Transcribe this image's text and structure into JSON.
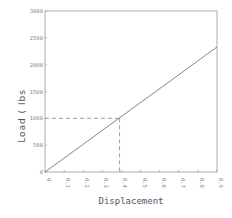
{
  "chart_data": {
    "type": "line",
    "title": "",
    "xlabel": "Displacement",
    "ylabel": "Load ( lbs",
    "xlim": [
      0,
      0.9
    ],
    "ylim": [
      0,
      3000
    ],
    "x_ticks": [
      "0",
      "0.1",
      "0.2",
      "0.3",
      "0.4",
      "0.5",
      "0.6",
      "0.7",
      "0.8",
      "0.9"
    ],
    "y_ticks": [
      "0",
      "500",
      "1000",
      "1500",
      "2000",
      "2500",
      "3000"
    ],
    "grid": false,
    "series": [
      {
        "name": "Load vs Displacement",
        "x": [
          0,
          0.9
        ],
        "y": [
          0,
          2330
        ],
        "color": "#777777"
      }
    ],
    "annotations": [
      {
        "type": "dashed-guide",
        "x": 0.39,
        "y": 1000,
        "label": ""
      }
    ]
  },
  "labels": {
    "xlabel": "Displacement",
    "ylabel": "Load ( lbs"
  }
}
